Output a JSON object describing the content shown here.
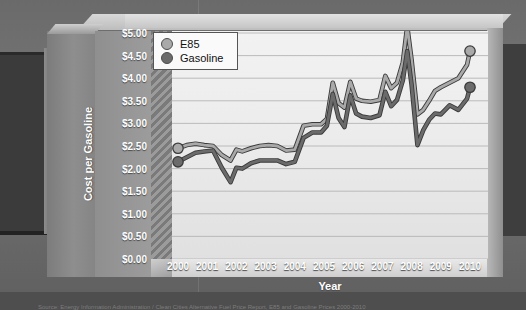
{
  "chart": {
    "xtitle": "Year",
    "ytitle_line1": "Cost per Gasoline",
    "ytitle_line2": "Gallon Equivalent",
    "legend": [
      {
        "label": "E85",
        "color": "#a9a9a9",
        "icon": "legend-dot-icon"
      },
      {
        "label": "Gasoline",
        "color": "#6b6b6b",
        "icon": "legend-dot-icon"
      }
    ],
    "ylabels": [
      "$5.00",
      "$4.50",
      "$4.00",
      "$3.50",
      "$3.00",
      "$2.50",
      "$2.00",
      "$1.50",
      "$1.00",
      "$0.50",
      "$0.00"
    ],
    "xlabels": [
      "2000",
      "2001",
      "2002",
      "2003",
      "2004",
      "2005",
      "2006",
      "2007",
      "2008",
      "2009",
      "2010"
    ],
    "caption": "Source: Energy Information Administration / Clean Cities Alternative Fuel Price Report, E85 and Gasoline Prices 2000-2010"
  },
  "chart_data": {
    "type": "line",
    "title": "",
    "xlabel": "Year",
    "ylabel": "Cost per Gasoline Gallon Equivalent",
    "xlim": [
      2000,
      2010
    ],
    "ylim": [
      0,
      5
    ],
    "ytick_values": [
      0,
      0.5,
      1,
      1.5,
      2,
      2.5,
      3,
      3.5,
      4,
      4.5,
      5
    ],
    "ytick_labels": [
      "$0.00",
      "$0.50",
      "$1.00",
      "$1.50",
      "$2.00",
      "$2.50",
      "$3.00",
      "$3.50",
      "$4.00",
      "$4.50",
      "$5.00"
    ],
    "xtick_values": [
      2000,
      2001,
      2002,
      2003,
      2004,
      2005,
      2006,
      2007,
      2008,
      2009,
      2010
    ],
    "xtick_labels": [
      "2000",
      "2001",
      "2002",
      "2003",
      "2004",
      "2005",
      "2006",
      "2007",
      "2008",
      "2009",
      "2010"
    ],
    "grid": "horizontal",
    "legend_position": "top-left",
    "markers": "endpoints-only",
    "x": [
      2000.0,
      2000.3,
      2000.6,
      2000.9,
      2001.2,
      2001.5,
      2001.8,
      2002.0,
      2002.2,
      2002.5,
      2002.8,
      2003.1,
      2003.4,
      2003.7,
      2004.0,
      2004.3,
      2004.6,
      2004.9,
      2005.1,
      2005.3,
      2005.5,
      2005.7,
      2005.9,
      2006.1,
      2006.3,
      2006.6,
      2006.9,
      2007.1,
      2007.3,
      2007.5,
      2007.7,
      2007.85,
      2008.0,
      2008.2,
      2008.4,
      2008.6,
      2008.8,
      2009.0,
      2009.3,
      2009.6,
      2009.9,
      2010.0
    ],
    "series": [
      {
        "name": "E85",
        "color": "#a9a9a9",
        "values": [
          2.45,
          2.52,
          2.55,
          2.52,
          2.5,
          2.3,
          2.18,
          2.42,
          2.38,
          2.45,
          2.5,
          2.52,
          2.5,
          2.4,
          2.42,
          2.95,
          2.98,
          2.98,
          3.1,
          3.9,
          3.45,
          3.35,
          3.92,
          3.55,
          3.5,
          3.48,
          3.52,
          4.05,
          3.78,
          3.9,
          4.35,
          5.15,
          4.4,
          3.2,
          3.3,
          3.5,
          3.72,
          3.8,
          3.9,
          4.0,
          4.3,
          4.6
        ]
      },
      {
        "name": "Gasoline",
        "color": "#6b6b6b",
        "values": [
          2.15,
          2.25,
          2.35,
          2.38,
          2.4,
          2.02,
          1.7,
          2.02,
          2.0,
          2.12,
          2.18,
          2.18,
          2.18,
          2.1,
          2.15,
          2.68,
          2.8,
          2.8,
          2.95,
          3.65,
          3.12,
          2.92,
          3.62,
          3.22,
          3.15,
          3.12,
          3.18,
          3.7,
          3.38,
          3.52,
          3.95,
          4.6,
          3.85,
          2.52,
          2.85,
          3.08,
          3.22,
          3.2,
          3.4,
          3.3,
          3.55,
          3.8
        ]
      }
    ]
  }
}
